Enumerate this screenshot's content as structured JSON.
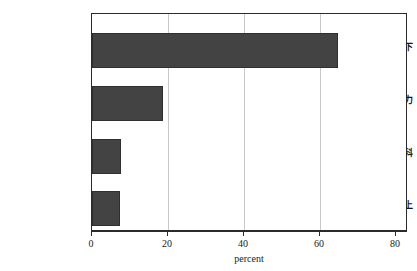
{
  "chart_data": {
    "type": "bar",
    "orientation": "horizontal",
    "title": "",
    "subtitle": "",
    "xlabel": "percent",
    "ylabel": "",
    "categories": [
      "初中或以下",
      "高中或同等学力",
      "大学专科",
      "大学本科或以上"
    ],
    "values": [
      64.6,
      18.8,
      7.6,
      7.3
    ],
    "series": [
      {
        "name": "percent",
        "values": [
          64.6,
          18.8,
          7.6,
          7.3
        ]
      }
    ],
    "xlim": [
      0,
      82.6
    ],
    "xticks": [
      0,
      20,
      40,
      60,
      80
    ],
    "xtick_labels": [
      "0",
      "20",
      "40",
      "60",
      "80"
    ],
    "yticks": [
      "初中或以下",
      "高中或同等学力",
      "大学专科",
      "大学本科或以上"
    ],
    "gridlines": {
      "vertical": [
        20,
        40,
        60
      ],
      "horizontal": [],
      "enabled": true,
      "color": "#c9c9c9"
    },
    "legend": {
      "visible": false,
      "position": "none",
      "entries": []
    },
    "annotations": [],
    "colors": {
      "bar_fill": "#434343",
      "bar_border": "#2f2f2f",
      "frame": "#2b2b2b",
      "grid": "#c9c9c9",
      "background": "#ffffff",
      "text": "#161616"
    }
  }
}
